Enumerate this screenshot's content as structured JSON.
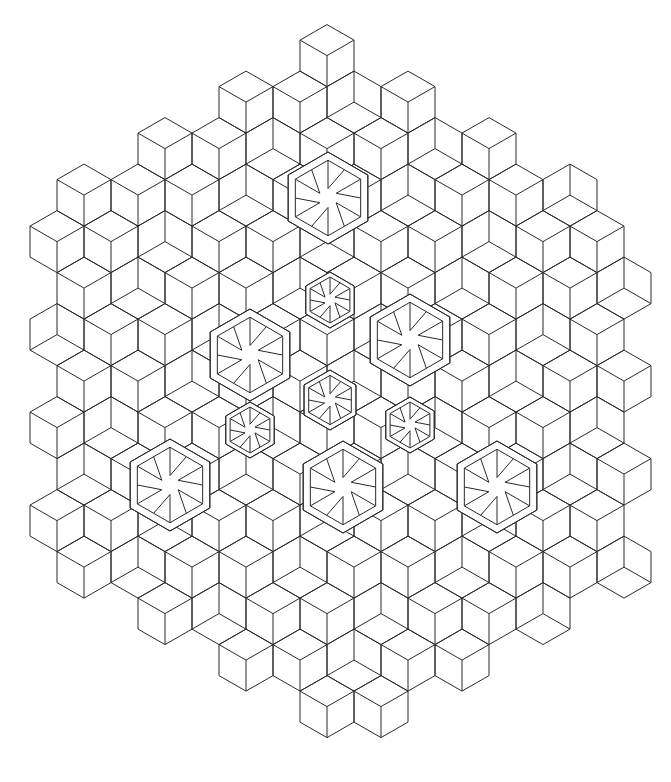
{
  "image": {
    "description": "Isometric cube pattern line-art coloring page forming a large hexagonal arrangement with nested hexagonal star motifs",
    "background_color": "#ffffff",
    "line_color": "#2a2a2a"
  },
  "grid": {
    "origin_x": 327,
    "origin_y": 40,
    "step_x": 27,
    "step_y": 15.6,
    "edge": 31,
    "cols_from_center": 11,
    "rows": 45
  },
  "outline": {
    "top": [
      327,
      40
    ],
    "bottom": [
      339,
      743
    ],
    "left_x": 33,
    "right_x": 634
  },
  "motifs": [
    {
      "cx": 328,
      "cy": 198,
      "r": 46
    },
    {
      "cx": 250,
      "cy": 355,
      "r": 46
    },
    {
      "cx": 410,
      "cy": 340,
      "r": 46
    },
    {
      "cx": 170,
      "cy": 485,
      "r": 46
    },
    {
      "cx": 343,
      "cy": 487,
      "r": 46
    },
    {
      "cx": 497,
      "cy": 487,
      "r": 46
    },
    {
      "cx": 330,
      "cy": 300,
      "r": 28
    },
    {
      "cx": 250,
      "cy": 430,
      "r": 28
    },
    {
      "cx": 410,
      "cy": 425,
      "r": 28
    },
    {
      "cx": 330,
      "cy": 400,
      "r": 30
    }
  ]
}
